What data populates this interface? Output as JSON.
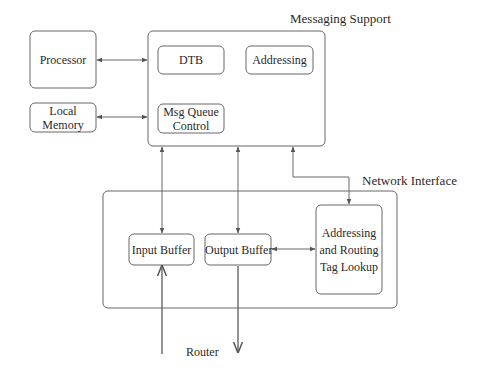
{
  "diagram": {
    "groups": {
      "messaging_support": {
        "title": "Messaging Support"
      },
      "network_interface": {
        "title": "Network Interface"
      }
    },
    "blocks": {
      "processor": "Processor",
      "local_memory_line1": "Local",
      "local_memory_line2": "Memory",
      "dtb": "DTB",
      "addressing": "Addressing",
      "msg_queue_line1": "Msg Queue",
      "msg_queue_line2": "Control",
      "input_buffer": "Input Buffer",
      "output_buffer": "Output Buffer",
      "tag_lookup_line1": "Addressing",
      "tag_lookup_line2": "and Routing",
      "tag_lookup_line3": "Tag Lookup"
    },
    "external": {
      "router": "Router"
    },
    "connections": [
      {
        "from": "Processor",
        "to": "Messaging Support",
        "type": "bidirectional"
      },
      {
        "from": "Local Memory",
        "to": "Messaging Support",
        "type": "bidirectional"
      },
      {
        "from": "Messaging Support",
        "to": "Input Buffer",
        "type": "bidirectional"
      },
      {
        "from": "Messaging Support",
        "to": "Output Buffer",
        "type": "bidirectional"
      },
      {
        "from": "Messaging Support",
        "to": "Addressing and Routing Tag Lookup",
        "type": "bidirectional"
      },
      {
        "from": "Output Buffer",
        "to": "Addressing and Routing Tag Lookup",
        "type": "bidirectional"
      },
      {
        "from": "Router",
        "to": "Input Buffer",
        "type": "directed"
      },
      {
        "from": "Output Buffer",
        "to": "Router",
        "type": "directed"
      }
    ],
    "colors": {
      "stroke": "#555555",
      "text": "#2a2a2a",
      "background": "#ffffff"
    }
  }
}
